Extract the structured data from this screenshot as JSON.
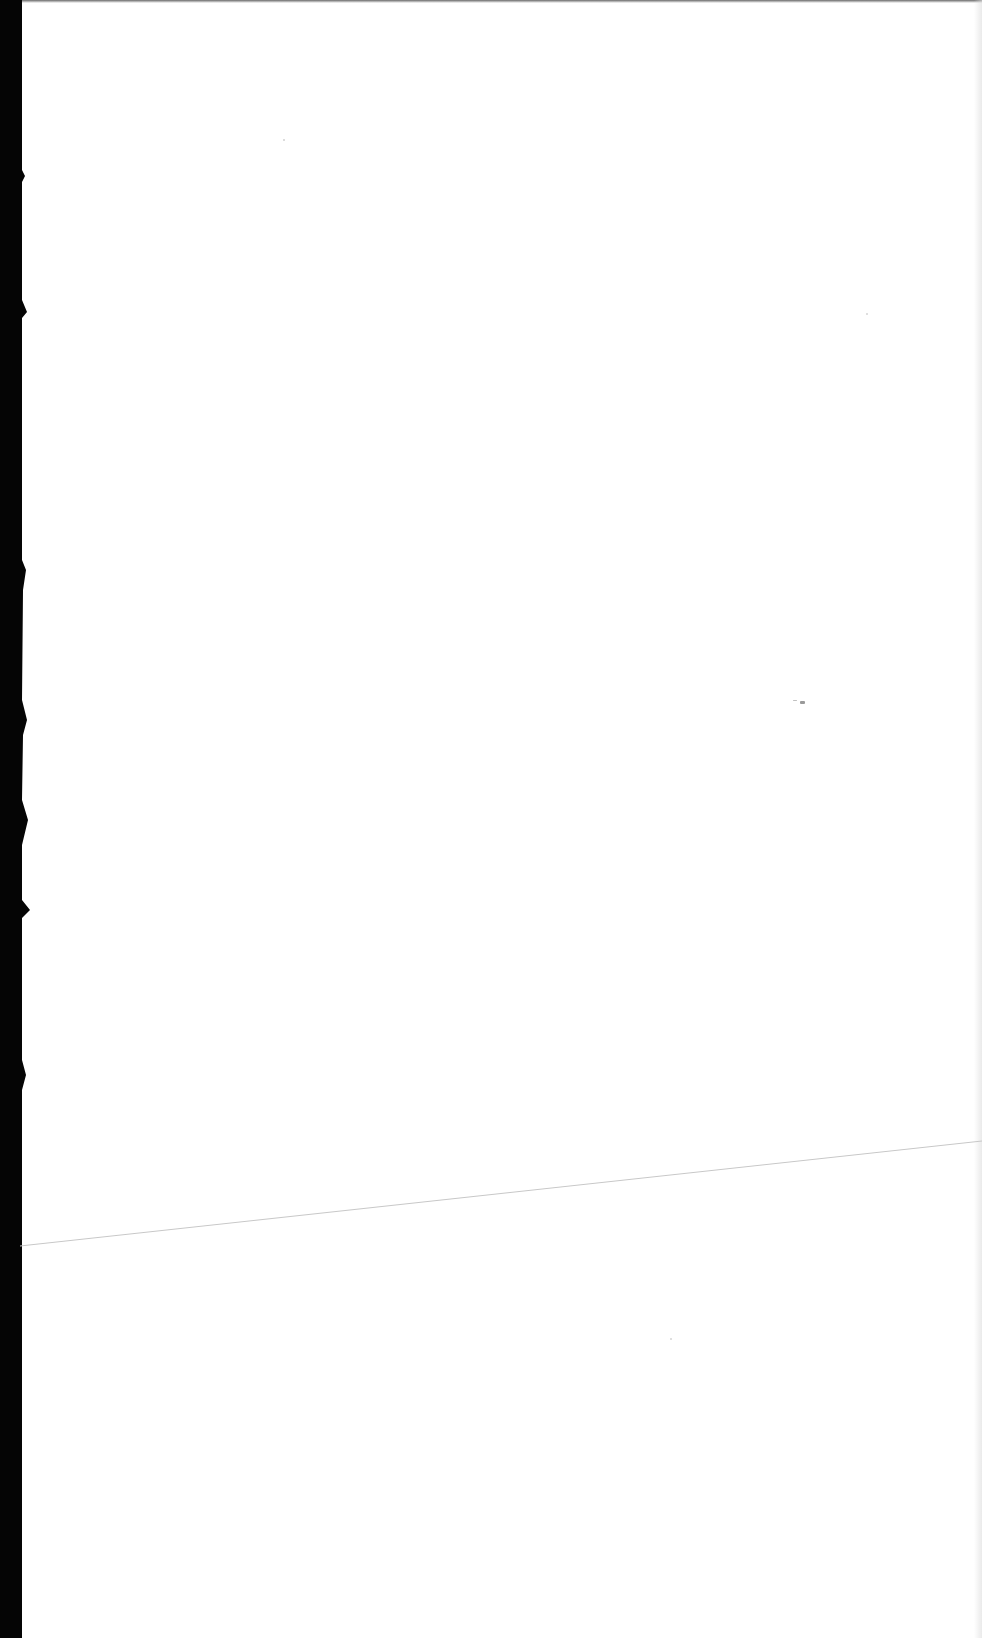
{
  "page": {
    "type": "blank-scanned-page",
    "text_content": [],
    "colors": {
      "paper": "#ffffff",
      "scanner_edge": "#050505",
      "crease_line": "#c8c8c8",
      "speck": "#9a9a9a"
    }
  }
}
